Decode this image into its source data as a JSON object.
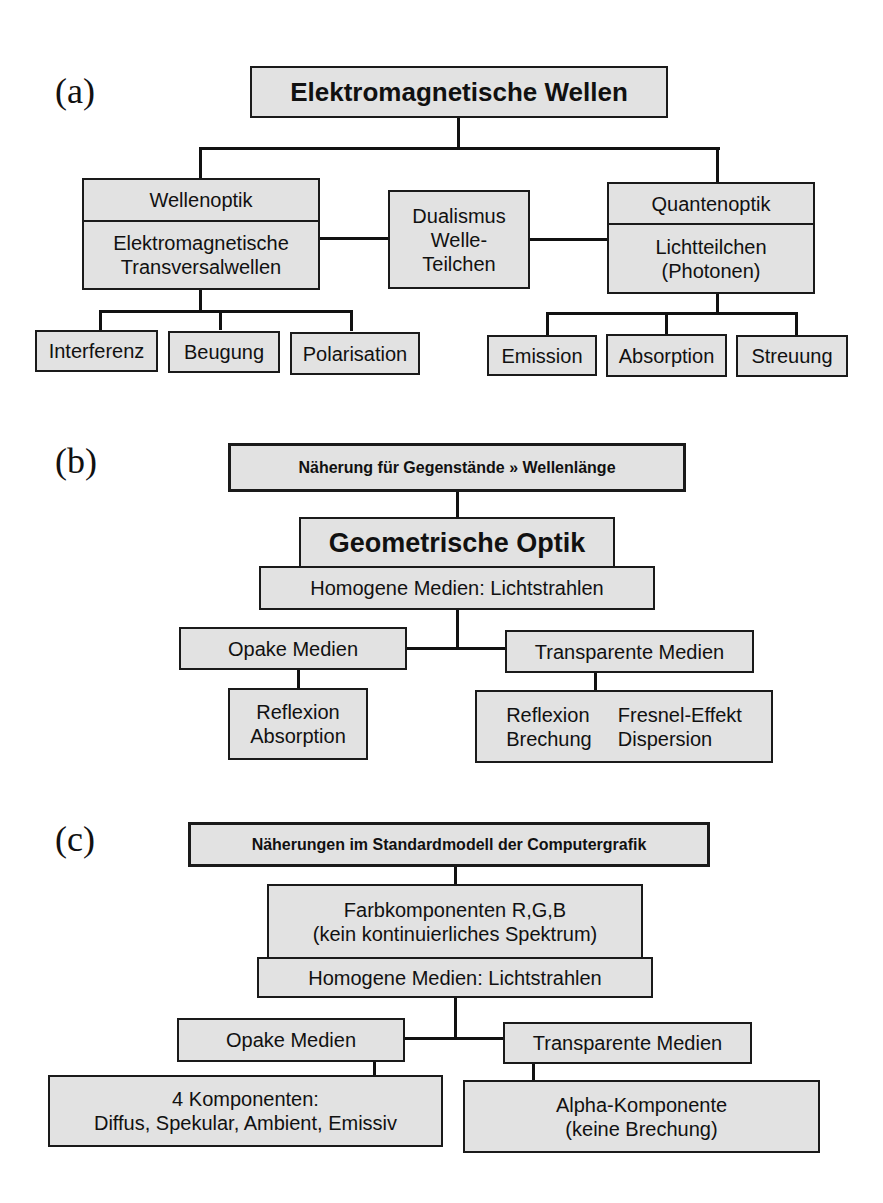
{
  "panel_a": {
    "label": "(a)",
    "root": "Elektromagnetische Wellen",
    "left": {
      "title": "Wellenoptik",
      "line1": "Elektromagnetische",
      "line2": "Transversalwellen"
    },
    "middle": {
      "line1": "Dualismus",
      "line2": "Welle-",
      "line3": "Teilchen"
    },
    "right": {
      "title": "Quantenoptik",
      "line1": "Lichtteilchen",
      "line2": "(Photonen)"
    },
    "left_children": [
      "Interferenz",
      "Beugung",
      "Polarisation"
    ],
    "right_children": [
      "Emission",
      "Absorption",
      "Streuung"
    ]
  },
  "panel_b": {
    "label": "(b)",
    "header": "Näherung für Gegenstände » Wellenlänge",
    "main": "Geometrische Optik",
    "sub": "Homogene Medien: Lichtstrahlen",
    "opaque": "Opake Medien",
    "transparent": "Transparente Medien",
    "opaque_effects": [
      "Reflexion",
      "Absorption"
    ],
    "transparent_effects": [
      "Reflexion",
      "Fresnel-Effekt",
      "Brechung",
      "Dispersion"
    ]
  },
  "panel_c": {
    "label": "(c)",
    "header": "Näherungen im Standardmodell der Computergrafik",
    "color_line1": "Farbkomponenten R,G,B",
    "color_line2": "(kein kontinuierliches Spektrum)",
    "sub": "Homogene Medien: Lichtstrahlen",
    "opaque": "Opake Medien",
    "transparent": "Transparente Medien",
    "opaque_line1": "4 Komponenten:",
    "opaque_line2": "Diffus, Spekular, Ambient, Emissiv",
    "transparent_line1": "Alpha-Komponente",
    "transparent_line2": "(keine Brechung)"
  }
}
